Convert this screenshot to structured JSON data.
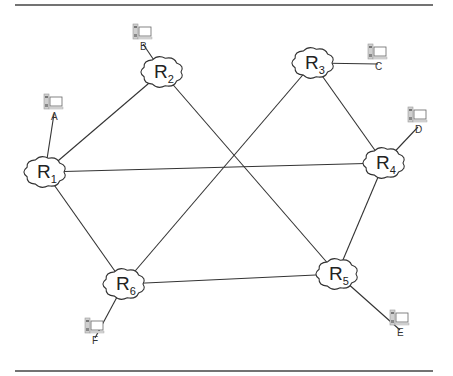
{
  "diagram": {
    "type": "network-topology",
    "routers": [
      {
        "id": "R1",
        "letter": "R",
        "sub": "1",
        "x": 45,
        "y": 172
      },
      {
        "id": "R2",
        "letter": "R",
        "sub": "2",
        "x": 162,
        "y": 72
      },
      {
        "id": "R3",
        "letter": "R",
        "sub": "3",
        "x": 313,
        "y": 63
      },
      {
        "id": "R4",
        "letter": "R",
        "sub": "4",
        "x": 384,
        "y": 163
      },
      {
        "id": "R5",
        "letter": "R",
        "sub": "5",
        "x": 337,
        "y": 274
      },
      {
        "id": "R6",
        "letter": "R",
        "sub": "6",
        "x": 124,
        "y": 284
      }
    ],
    "hosts": [
      {
        "id": "A",
        "label": "A",
        "attached_to": "R1",
        "x": 54,
        "y": 106
      },
      {
        "id": "B",
        "label": "B",
        "attached_to": "R2",
        "x": 143,
        "y": 36
      },
      {
        "id": "C",
        "label": "C",
        "attached_to": "R3",
        "x": 378,
        "y": 56
      },
      {
        "id": "D",
        "label": "D",
        "attached_to": "R4",
        "x": 418,
        "y": 119
      },
      {
        "id": "E",
        "label": "E",
        "attached_to": "R5",
        "x": 400,
        "y": 322
      },
      {
        "id": "F",
        "label": "F",
        "attached_to": "R6",
        "x": 95,
        "y": 330
      }
    ],
    "links": [
      [
        "R1",
        "R2"
      ],
      [
        "R1",
        "R4"
      ],
      [
        "R1",
        "R6"
      ],
      [
        "R2",
        "R5"
      ],
      [
        "R3",
        "R4"
      ],
      [
        "R3",
        "R6"
      ],
      [
        "R4",
        "R5"
      ],
      [
        "R5",
        "R6"
      ]
    ],
    "colors": {
      "line": "#333333",
      "host_icon": "#9a9a9a"
    }
  }
}
